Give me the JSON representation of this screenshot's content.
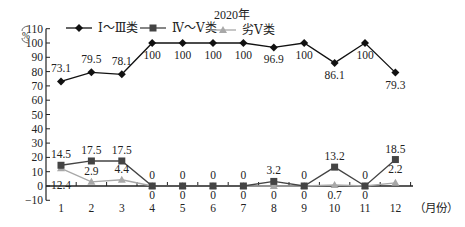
{
  "chart_data": {
    "type": "line",
    "title": "2020年",
    "xlabel": "（月份）",
    "ylabel": "%",
    "ylim": [
      -10,
      110
    ],
    "yticks": [
      -10,
      0,
      10,
      20,
      30,
      40,
      50,
      60,
      70,
      80,
      90,
      100,
      110
    ],
    "grid": false,
    "legend_position": "top",
    "categories": [
      "1",
      "2",
      "3",
      "4",
      "5",
      "6",
      "7",
      "8",
      "9",
      "10",
      "11",
      "12"
    ],
    "series": [
      {
        "name": "Ⅰ～Ⅲ类",
        "marker": "diamond",
        "color": "#111111",
        "values": [
          73.1,
          79.5,
          78.1,
          100,
          100,
          100,
          100,
          96.9,
          100,
          86.1,
          100,
          79.3
        ]
      },
      {
        "name": "Ⅳ～Ⅴ类",
        "marker": "square",
        "color": "#444444",
        "values": [
          14.5,
          17.5,
          17.5,
          0,
          0,
          0,
          0,
          3.2,
          0,
          13.2,
          0,
          18.5
        ]
      },
      {
        "name": "劣Ⅴ类",
        "marker": "triangle",
        "color": "#a8a8a8",
        "values": [
          12.4,
          2.9,
          4.4,
          0,
          0,
          0,
          0,
          0,
          0,
          0.7,
          0,
          2.2
        ]
      }
    ]
  }
}
